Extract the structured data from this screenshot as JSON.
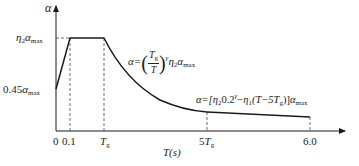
{
  "diagram": {
    "type": "response-spectrum",
    "y_axis": {
      "label": "α"
    },
    "x_axis": {
      "label": "T(s)"
    },
    "y_ticks": [
      {
        "id": "plateau",
        "label_main": "η",
        "label_sub": "2",
        "label_alpha": "α",
        "label_alpha_sub": "max"
      },
      {
        "id": "start",
        "label_prefix": "0.45",
        "label_alpha": "α",
        "label_alpha_sub": "max"
      }
    ],
    "x_ticks": {
      "zero": "0",
      "t01": "0.1",
      "tg_main": "T",
      "tg_sub": "g",
      "tg5_prefix": "5",
      "tg5_main": "T",
      "tg5_sub": "g",
      "t6": "6.0"
    },
    "equations": {
      "decay": {
        "lhs": "α=",
        "frac_num_main": "T",
        "frac_num_sub": "g",
        "frac_den": "T",
        "exponent": "γ",
        "eta": "η",
        "eta_sub": "2",
        "alpha": "α",
        "alpha_sub": "max"
      },
      "linear": {
        "lhs": "α=[",
        "eta2": "η",
        "eta2_sub": "2",
        "base": "0.2",
        "exponent": "γ",
        "minus": "−",
        "eta1": "η",
        "eta1_sub": "1",
        "paren_open": "(T−5",
        "tg_main": "T",
        "tg_sub": "g",
        "paren_close": ")]",
        "alpha": "α",
        "alpha_sub": "max"
      }
    },
    "segments": [
      {
        "name": "rising",
        "from_T": 0,
        "to_T": 0.1,
        "description": "linear rise from 0.45αmax to η2αmax"
      },
      {
        "name": "plateau",
        "from_T": 0.1,
        "to_T": "Tg",
        "description": "constant η2αmax"
      },
      {
        "name": "curved-decay",
        "from_T": "Tg",
        "to_T": "5Tg",
        "description": "α=(Tg/T)^γ η2αmax"
      },
      {
        "name": "linear-decay",
        "from_T": "5Tg",
        "to_T": 6.0,
        "description": "α=[η2 0.2^γ − η1(T−5Tg)]αmax"
      }
    ],
    "colors": {
      "line": "#1a1a1a",
      "dash": "#444444"
    }
  }
}
